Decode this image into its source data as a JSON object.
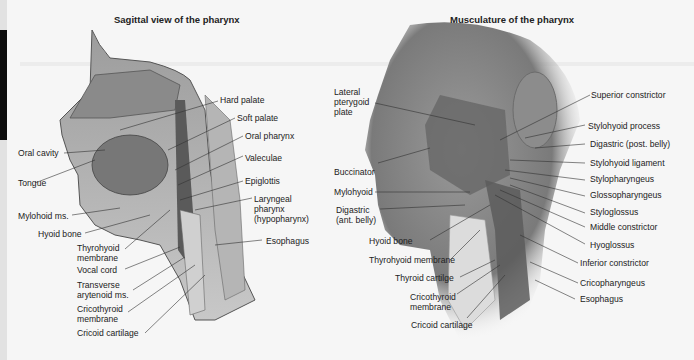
{
  "left_panel": {
    "title": "Sagittal view of the pharynx",
    "labels": {
      "hard_palate": "Hard palate",
      "soft_palate": "Soft palate",
      "oral_pharynx": "Oral pharynx",
      "valeculae": "Valeculae",
      "epiglottis": "Epiglottis",
      "laryngeal_1": "Laryngeal",
      "laryngeal_2": "pharynx",
      "laryngeal_3": "(hypopharynx)",
      "esophagus": "Esophagus",
      "oral_cavity": "Oral cavity",
      "tongue": "Tongue",
      "mylohoid": "Mylohoid ms.",
      "hyoid": "Hyoid bone",
      "thyrohyoid_1": "Thyrohyoid",
      "thyrohyoid_2": "membrane",
      "vocal_cord": "Vocal cord",
      "transverse_1": "Transverse",
      "transverse_2": "arytenoid ms.",
      "cricothyroid_1": "Cricothyroid",
      "cricothyroid_2": "membrane",
      "cricoid": "Cricoid cartilage"
    }
  },
  "right_panel": {
    "title": "Musculature of the pharynx",
    "labels": {
      "lateral_1": "Lateral",
      "lateral_2": "pterygoid",
      "lateral_3": "plate",
      "buccinator": "Buccinator",
      "mylohyoid": "Mylohyoid",
      "digastric_ant_1": "Digastric",
      "digastric_ant_2": "(ant. belly)",
      "hyoid": "Hyoid bone",
      "thyrohyoid": "Thyrohyoid membrane",
      "thyroid": "Thyroid cartilge",
      "cricothyroid_1": "Cricothyroid",
      "cricothyroid_2": "membrane",
      "cricoid": "Cricoid cartilage",
      "superior": "Superior constrictor",
      "stylohyoid_process": "Stylohyoid process",
      "digastric_post": "Digastric (post. belly)",
      "stylohyoid_ligament": "Stylohyoid ligament",
      "stylopharyngeus": "Stylopharyngeus",
      "glossopharyngeus": "Glossopharyngeus",
      "styloglossus": "Styloglossus",
      "middle": "Middle constrictor",
      "hyoglossus": "Hyoglossus",
      "inferior": "Inferior constrictor",
      "cricopharyngeus": "Cricopharyngeus",
      "esophagus": "Esophagus"
    }
  }
}
